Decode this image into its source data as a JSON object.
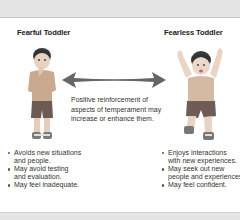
{
  "figure": {
    "left": {
      "title": "Fearful Toddler",
      "image_label": "fearful-toddler-illustration",
      "bullets": [
        {
          "lines": [
            "Avoids new situations",
            "and people."
          ]
        },
        {
          "lines": [
            "May avoid testing",
            "and evaluation."
          ]
        },
        {
          "lines": [
            "May feel inadequate."
          ]
        }
      ]
    },
    "right": {
      "title": "Fearless Toddler",
      "image_label": "fearless-toddler-illustration",
      "bullets": [
        {
          "lines": [
            "Enjoys interactions",
            "with new experiences."
          ]
        },
        {
          "lines": [
            "May seek out new",
            "people and experiences."
          ]
        },
        {
          "lines": [
            "May feel confident."
          ]
        }
      ]
    },
    "center": {
      "arrow": "double-headed-arrow",
      "arrow_color": "#666666",
      "lines": [
        "Positive reinforcement of",
        "aspects of temperament may",
        "increase or enhance them."
      ]
    }
  }
}
